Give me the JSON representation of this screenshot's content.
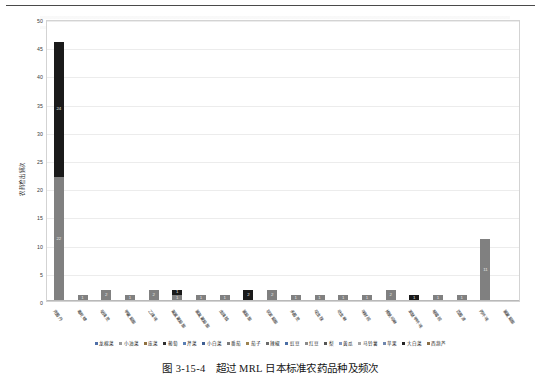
{
  "caption": {
    "figure_number": "图 3-15-4",
    "title": "超过 MRL 日本标准农药品种及频次"
  },
  "chart_data": {
    "type": "bar",
    "stacked": true,
    "title": "",
    "xlabel": "",
    "ylabel": "农药检出频次",
    "ylim": [
      0,
      50
    ],
    "yticks": [
      0,
      5,
      10,
      15,
      20,
      25,
      30,
      35,
      40,
      45,
      50
    ],
    "grid": true,
    "legend_position": "bottom",
    "categories": [
      "克菌丹",
      "毒死蜱",
      "哒螨灵",
      "甲氰菊酯",
      "乙螨唑",
      "氟氯氰菊酯",
      "氯氟氰菊酯",
      "虫螨腈",
      "氯菊酯",
      "联苯菊酯",
      "多菌灵",
      "啶虫脒",
      "吡虫啉",
      "咪鲜胺",
      "烯酰吗啉",
      "苯醚甲环唑",
      "嘧霉胺",
      "百菌清",
      "丙环唑",
      "氯氰菊酯"
    ],
    "series": [
      {
        "name": "lower",
        "color": "#808080",
        "values": [
          22,
          1,
          2,
          1,
          2,
          1,
          1,
          1,
          0,
          2,
          1,
          1,
          1,
          1,
          2,
          0,
          1,
          1,
          11,
          0
        ]
      },
      {
        "name": "upper",
        "color": "#1a1a1a",
        "values": [
          24,
          0,
          0,
          0,
          0,
          1,
          0,
          0,
          2,
          0,
          0,
          0,
          0,
          0,
          0,
          1,
          0,
          0,
          0,
          0
        ]
      }
    ],
    "bar_labels": {
      "stacked_first_bar_upper": "24",
      "stacked_first_bar_lower": "22",
      "tall_right_bar": "11"
    },
    "legend_entries": [
      {
        "label": "龙棉菜",
        "color": "#4f6fa8"
      },
      {
        "label": "小油菜",
        "color": "#9a9a9a"
      },
      {
        "label": "庞菜",
        "color": "#8f7040"
      },
      {
        "label": "葡萄",
        "color": "#2f2f2f"
      },
      {
        "label": "芹菜",
        "color": "#5a7fb5"
      },
      {
        "label": "小白菜",
        "color": "#3f5f93"
      },
      {
        "label": "番茄",
        "color": "#7a7a7a"
      },
      {
        "label": "茄子",
        "color": "#9d8350"
      },
      {
        "label": "辣椒",
        "color": "#6b6b6b"
      },
      {
        "label": "豇豆",
        "color": "#4a6ea5"
      },
      {
        "label": "红豆",
        "color": "#8a8a8a"
      },
      {
        "label": "梨",
        "color": "#555555"
      },
      {
        "label": "黄瓜",
        "color": "#7f96c0"
      },
      {
        "label": "马铃薯",
        "color": "#a5a5a5"
      },
      {
        "label": "苹果",
        "color": "#6f86ae"
      },
      {
        "label": "大白菜",
        "color": "#242424"
      },
      {
        "label": "西葫芦",
        "color": "#8b6f45"
      }
    ]
  }
}
